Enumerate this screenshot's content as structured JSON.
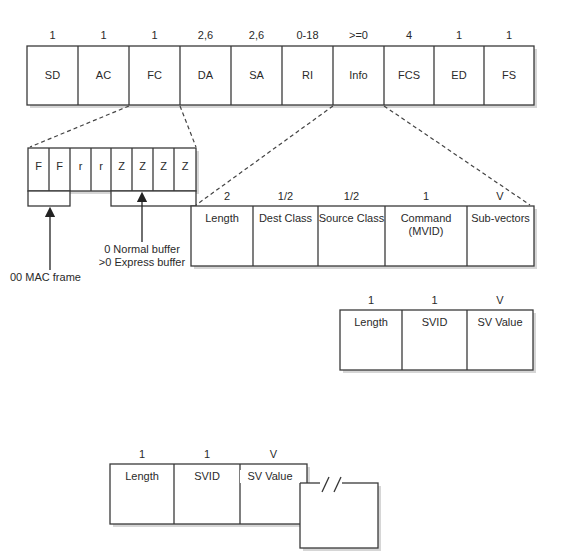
{
  "frame": {
    "fields": [
      {
        "size": "1",
        "name": "SD"
      },
      {
        "size": "1",
        "name": "AC"
      },
      {
        "size": "1",
        "name": "FC"
      },
      {
        "size": "2,6",
        "name": "DA"
      },
      {
        "size": "2,6",
        "name": "SA"
      },
      {
        "size": "0-18",
        "name": "RI"
      },
      {
        "size": ">=0",
        "name": "Info"
      },
      {
        "size": "4",
        "name": "FCS"
      },
      {
        "size": "1",
        "name": "ED"
      },
      {
        "size": "1",
        "name": "FS"
      }
    ]
  },
  "fc_bits": {
    "bits": [
      "F",
      "F",
      "r",
      "r",
      "Z",
      "Z",
      "Z",
      "Z"
    ],
    "ff_annotation": "00 MAC frame",
    "zzzz_annotation_line1": "0 Normal buffer",
    "zzzz_annotation_line2": ">0 Express buffer"
  },
  "vector": {
    "fields": [
      {
        "size": "2",
        "name": "Length"
      },
      {
        "size": "1/2",
        "name": "Dest Class"
      },
      {
        "size": "1/2",
        "name": "Source Class"
      },
      {
        "size": "1",
        "name": "Command",
        "name2": "(MVID)"
      },
      {
        "size": "V",
        "name": "Sub-vectors"
      }
    ]
  },
  "subvector_1": {
    "fields": [
      {
        "size": "1",
        "name": "Length"
      },
      {
        "size": "1",
        "name": "SVID"
      },
      {
        "size": "V",
        "name": "SV Value"
      }
    ]
  },
  "subvector_2": {
    "fields": [
      {
        "size": "1",
        "name": "Length"
      },
      {
        "size": "1",
        "name": "SVID"
      },
      {
        "size": "V",
        "name": "SV Value"
      }
    ],
    "continuation_mark": "//"
  }
}
